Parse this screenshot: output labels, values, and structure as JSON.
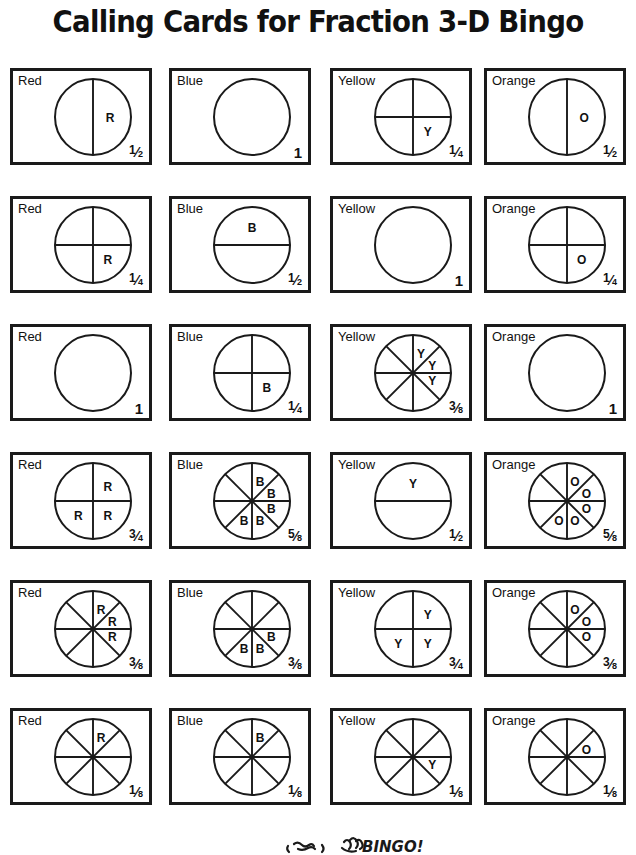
{
  "document": {
    "title": "Calling Cards for Fraction 3-D Bingo"
  },
  "labels": {
    "red": "Red",
    "blue": "Blue",
    "yellow": "Yellow",
    "orange": "Orange"
  },
  "cards": [
    {
      "color_label": "Red",
      "mark": "R",
      "divisions": 2,
      "orientation": "vertical",
      "shaded_sectors": [
        0
      ],
      "fraction_text": "1/2",
      "numerator": "1",
      "denominator": "2",
      "whole": false
    },
    {
      "color_label": "Blue",
      "mark": "B",
      "divisions": 1,
      "orientation": "none",
      "shaded_sectors": [],
      "fraction_text": "1",
      "numerator": "",
      "denominator": "",
      "whole": true
    },
    {
      "color_label": "Yellow",
      "mark": "Y",
      "divisions": 4,
      "orientation": "cross",
      "shaded_sectors": [
        1
      ],
      "fraction_text": "1/4",
      "numerator": "1",
      "denominator": "4",
      "whole": false
    },
    {
      "color_label": "Orange",
      "mark": "O",
      "divisions": 2,
      "orientation": "vertical",
      "shaded_sectors": [
        0
      ],
      "fraction_text": "1/2",
      "numerator": "1",
      "denominator": "2",
      "whole": false
    },
    {
      "color_label": "Red",
      "mark": "R",
      "divisions": 4,
      "orientation": "cross",
      "shaded_sectors": [
        1
      ],
      "fraction_text": "1/4",
      "numerator": "1",
      "denominator": "4",
      "whole": false
    },
    {
      "color_label": "Blue",
      "mark": "B",
      "divisions": 2,
      "orientation": "horizontal",
      "shaded_sectors": [
        0
      ],
      "fraction_text": "1/2",
      "numerator": "1",
      "denominator": "2",
      "whole": false
    },
    {
      "color_label": "Yellow",
      "mark": "Y",
      "divisions": 1,
      "orientation": "none",
      "shaded_sectors": [],
      "fraction_text": "1",
      "numerator": "",
      "denominator": "",
      "whole": true
    },
    {
      "color_label": "Orange",
      "mark": "O",
      "divisions": 4,
      "orientation": "cross",
      "shaded_sectors": [
        1
      ],
      "fraction_text": "1/4",
      "numerator": "1",
      "denominator": "4",
      "whole": false
    },
    {
      "color_label": "Red",
      "mark": "R",
      "divisions": 1,
      "orientation": "none",
      "shaded_sectors": [],
      "fraction_text": "1",
      "numerator": "",
      "denominator": "",
      "whole": true
    },
    {
      "color_label": "Blue",
      "mark": "B",
      "divisions": 4,
      "orientation": "cross",
      "shaded_sectors": [
        1
      ],
      "fraction_text": "1/4",
      "numerator": "1",
      "denominator": "4",
      "whole": false
    },
    {
      "color_label": "Yellow",
      "mark": "Y",
      "divisions": 8,
      "orientation": "eighths",
      "shaded_sectors": [
        0,
        1,
        2
      ],
      "fraction_text": "3/8",
      "numerator": "3",
      "denominator": "8",
      "whole": false
    },
    {
      "color_label": "Orange",
      "mark": "O",
      "divisions": 1,
      "orientation": "none",
      "shaded_sectors": [],
      "fraction_text": "1",
      "numerator": "",
      "denominator": "",
      "whole": true
    },
    {
      "color_label": "Red",
      "mark": "R",
      "divisions": 4,
      "orientation": "cross",
      "shaded_sectors": [
        0,
        1,
        2
      ],
      "fraction_text": "3/4",
      "numerator": "3",
      "denominator": "4",
      "whole": false
    },
    {
      "color_label": "Blue",
      "mark": "B",
      "divisions": 8,
      "orientation": "eighths",
      "shaded_sectors": [
        0,
        1,
        2,
        3,
        4
      ],
      "fraction_text": "5/8",
      "numerator": "5",
      "denominator": "8",
      "whole": false
    },
    {
      "color_label": "Yellow",
      "mark": "Y",
      "divisions": 2,
      "orientation": "horizontal",
      "shaded_sectors": [
        0
      ],
      "fraction_text": "1/2",
      "numerator": "1",
      "denominator": "2",
      "whole": false
    },
    {
      "color_label": "Orange",
      "mark": "O",
      "divisions": 8,
      "orientation": "eighths",
      "shaded_sectors": [
        0,
        1,
        2,
        3,
        4
      ],
      "fraction_text": "5/8",
      "numerator": "5",
      "denominator": "8",
      "whole": false
    },
    {
      "color_label": "Red",
      "mark": "R",
      "divisions": 8,
      "orientation": "eighths",
      "shaded_sectors": [
        0,
        1,
        2
      ],
      "fraction_text": "3/8",
      "numerator": "3",
      "denominator": "8",
      "whole": false
    },
    {
      "color_label": "Blue",
      "mark": "B",
      "divisions": 8,
      "orientation": "eighths",
      "shaded_sectors": [
        2,
        3,
        4
      ],
      "fraction_text": "3/8",
      "numerator": "3",
      "denominator": "8",
      "whole": false
    },
    {
      "color_label": "Yellow",
      "mark": "Y",
      "divisions": 4,
      "orientation": "cross",
      "shaded_sectors": [
        0,
        1,
        2
      ],
      "fraction_text": "3/4",
      "numerator": "3",
      "denominator": "4",
      "whole": false
    },
    {
      "color_label": "Orange",
      "mark": "O",
      "divisions": 8,
      "orientation": "eighths",
      "shaded_sectors": [
        0,
        1,
        2
      ],
      "fraction_text": "3/8",
      "numerator": "3",
      "denominator": "8",
      "whole": false
    },
    {
      "color_label": "Red",
      "mark": "R",
      "divisions": 8,
      "orientation": "eighths",
      "shaded_sectors": [
        0
      ],
      "fraction_text": "1/8",
      "numerator": "1",
      "denominator": "8",
      "whole": false
    },
    {
      "color_label": "Blue",
      "mark": "B",
      "divisions": 8,
      "orientation": "eighths",
      "shaded_sectors": [
        0
      ],
      "fraction_text": "1/8",
      "numerator": "1",
      "denominator": "8",
      "whole": false
    },
    {
      "color_label": "Yellow",
      "mark": "Y",
      "divisions": 8,
      "orientation": "eighths",
      "shaded_sectors": [
        2
      ],
      "fraction_text": "1/8",
      "numerator": "1",
      "denominator": "8",
      "whole": false
    },
    {
      "color_label": "Orange",
      "mark": "O",
      "divisions": 8,
      "orientation": "eighths",
      "shaded_sectors": [
        1
      ],
      "fraction_text": "1/8",
      "numerator": "1",
      "denominator": "8",
      "whole": false
    }
  ],
  "footer": {
    "doodle_word": "BINGO!"
  }
}
